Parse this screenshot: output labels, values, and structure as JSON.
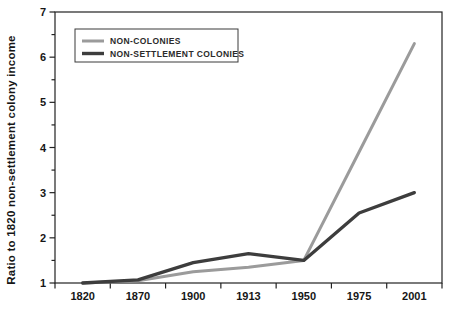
{
  "figure": {
    "y_axis_title": "Ratio to 1820 non-settlement colony income"
  },
  "chart_data": {
    "type": "line",
    "title": "",
    "xlabel": "",
    "ylabel": "Ratio to 1820 non-settlement colony income",
    "categories": [
      "1820",
      "1870",
      "1900",
      "1913",
      "1950",
      "1975",
      "2001"
    ],
    "series": [
      {
        "name": "NON-COLONIES",
        "color": "#9b9b9b",
        "values": [
          1.0,
          1.05,
          1.25,
          1.35,
          1.5,
          3.9,
          6.3
        ]
      },
      {
        "name": "NON-SETTLEMENT COLONIES",
        "color": "#3d3d3d",
        "values": [
          1.0,
          1.07,
          1.45,
          1.65,
          1.5,
          2.55,
          3.0
        ]
      }
    ],
    "ylim": [
      1,
      7
    ],
    "y_major_ticks": [
      1,
      2,
      3,
      4,
      5,
      6,
      7
    ],
    "y_minor_tick_interval": 0.5,
    "grid": false,
    "legend_position": "top-left-inside",
    "axis_color": "#222222",
    "background": "#ffffff"
  }
}
